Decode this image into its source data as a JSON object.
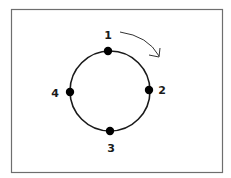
{
  "diagram": {
    "type": "cycle",
    "frame": {
      "x": 11,
      "y": 9,
      "width": 212,
      "height": 164,
      "stroke": "#6e6e6e"
    },
    "circle": {
      "cx": 110,
      "cy": 91,
      "r": 40,
      "stroke": "#1a1a1a"
    },
    "nodes": [
      {
        "id": "1",
        "label": "1",
        "position": "top"
      },
      {
        "id": "2",
        "label": "2",
        "position": "right"
      },
      {
        "id": "3",
        "label": "3",
        "position": "bottom"
      },
      {
        "id": "4",
        "label": "4",
        "position": "left"
      }
    ],
    "direction": "clockwise",
    "arrow": {
      "meaning": "clockwise-direction-arrow"
    }
  }
}
